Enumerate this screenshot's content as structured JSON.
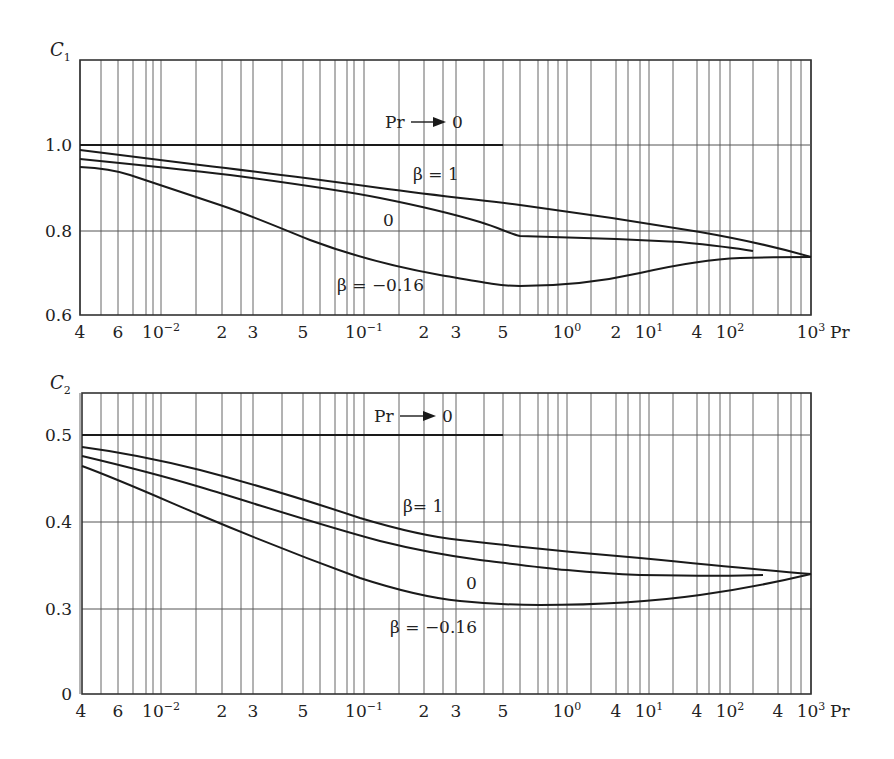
{
  "chart_data": [
    {
      "type": "line",
      "title": "",
      "ylabel": "C₁",
      "xlabel": "Pr",
      "x_scale": "log (nonuniform decades)",
      "x_tick_labels": [
        "4",
        "6",
        "10⁻²",
        "2",
        "3",
        "5",
        "10⁻¹",
        "2",
        "3",
        "5",
        "10⁰",
        "2",
        "10¹",
        "4",
        "10²",
        "10³",
        "Pr"
      ],
      "y_tick_labels": [
        "0.6",
        "0.8",
        "1.0"
      ],
      "ylim": [
        0.6,
        1.2
      ],
      "xlim": [
        0.004,
        1000
      ],
      "grid": true,
      "series": [
        {
          "name": "Pr → 0",
          "x": [
            0.004,
            0.5
          ],
          "values": [
            1.0,
            1.0
          ]
        },
        {
          "name": "β = 1",
          "x": [
            0.004,
            0.01,
            0.03,
            0.1,
            0.3,
            1,
            10,
            100,
            1000
          ],
          "values": [
            0.99,
            0.97,
            0.945,
            0.92,
            0.89,
            0.86,
            0.82,
            0.78,
            0.74
          ]
        },
        {
          "name": "0",
          "x": [
            0.004,
            0.01,
            0.03,
            0.1,
            0.3,
            0.6,
            1,
            10,
            200
          ],
          "values": [
            0.97,
            0.955,
            0.925,
            0.89,
            0.85,
            0.79,
            0.785,
            0.775,
            0.75
          ]
        },
        {
          "name": "β = −0.16",
          "x": [
            0.004,
            0.006,
            0.01,
            0.03,
            0.05,
            0.1,
            0.3,
            0.6,
            1,
            10,
            100,
            1000
          ],
          "values": [
            0.95,
            0.945,
            0.915,
            0.84,
            0.8,
            0.755,
            0.705,
            0.675,
            0.68,
            0.715,
            0.735,
            0.74
          ]
        }
      ],
      "annotations": [
        "Pr → 0",
        "β = 1",
        "0",
        "β = −0.16"
      ]
    },
    {
      "type": "line",
      "title": "",
      "ylabel": "C₂",
      "xlabel": "Pr",
      "x_scale": "log (nonuniform decades)",
      "x_tick_labels": [
        "4",
        "6",
        "10⁻²",
        "2",
        "3",
        "5",
        "10⁻¹",
        "2",
        "3",
        "5",
        "10⁰",
        "4",
        "10¹",
        "4",
        "10²",
        "4",
        "10³",
        "Pr"
      ],
      "y_tick_labels": [
        "0",
        "0.3",
        "0.4",
        "0.5"
      ],
      "ylim": [
        0,
        0.55
      ],
      "xlim": [
        0.004,
        1000
      ],
      "grid": true,
      "series": [
        {
          "name": "Pr → 0",
          "x": [
            0.004,
            0.5
          ],
          "values": [
            0.5,
            0.5
          ]
        },
        {
          "name": "β = 1",
          "x": [
            0.004,
            0.01,
            0.03,
            0.1,
            0.3,
            1,
            10,
            100,
            1000
          ],
          "values": [
            0.487,
            0.47,
            0.44,
            0.4,
            0.378,
            0.365,
            0.355,
            0.347,
            0.34
          ]
        },
        {
          "name": "0",
          "x": [
            0.004,
            0.01,
            0.03,
            0.1,
            0.3,
            1,
            10,
            100,
            300
          ],
          "values": [
            0.477,
            0.45,
            0.415,
            0.375,
            0.355,
            0.343,
            0.34,
            0.34,
            0.34
          ]
        },
        {
          "name": "β = −0.16",
          "x": [
            0.004,
            0.01,
            0.03,
            0.1,
            0.3,
            0.6,
            1,
            10,
            100,
            1000
          ],
          "values": [
            0.465,
            0.425,
            0.38,
            0.335,
            0.312,
            0.305,
            0.305,
            0.31,
            0.325,
            0.34
          ]
        }
      ],
      "annotations": [
        "Pr → 0",
        "β= 1",
        "0",
        "β = −0.16"
      ]
    }
  ],
  "top": {
    "ylabel": "C",
    "ylabel_sub": "1",
    "y_ticks": [
      {
        "label": "1.0",
        "y": 145
      },
      {
        "label": "0.8",
        "y": 231
      },
      {
        "label": "0.6",
        "y": 315
      }
    ],
    "x_ticks": [
      {
        "label": "4",
        "x": 80
      },
      {
        "label": "6",
        "x": 118
      },
      {
        "label": "10",
        "sup": "−2",
        "x": 161
      },
      {
        "label": "2",
        "x": 222
      },
      {
        "label": "3",
        "x": 253
      },
      {
        "label": "5",
        "x": 303
      },
      {
        "label": "10",
        "sup": "−1",
        "x": 364
      },
      {
        "label": "2",
        "x": 424
      },
      {
        "label": "3",
        "x": 456
      },
      {
        "label": "5",
        "x": 503
      },
      {
        "label": "10",
        "sup": "0",
        "x": 567
      },
      {
        "label": "2",
        "x": 616
      },
      {
        "label": "10",
        "sup": "1",
        "x": 649
      },
      {
        "label": "4",
        "x": 697
      },
      {
        "label": "10",
        "sup": "2",
        "x": 730
      },
      {
        "label": "10",
        "sup": "3",
        "x": 811
      }
    ],
    "pr_label": "Pr",
    "pr_limit_label": "Pr",
    "pr_limit_value": "0",
    "label_beta1": "β = 1",
    "label_beta0": "0",
    "label_betaneg": "β = −0.16"
  },
  "bottom": {
    "ylabel": "C",
    "ylabel_sub": "2",
    "y_ticks": [
      {
        "label": "0.5",
        "y": 435
      },
      {
        "label": "0.4",
        "y": 522
      },
      {
        "label": "0.3",
        "y": 609
      },
      {
        "label": "0",
        "y": 694
      }
    ],
    "x_ticks": [
      {
        "label": "4",
        "x": 81
      },
      {
        "label": "6",
        "x": 118
      },
      {
        "label": "10",
        "sup": "−2",
        "x": 161
      },
      {
        "label": "2",
        "x": 222
      },
      {
        "label": "3",
        "x": 253
      },
      {
        "label": "5",
        "x": 303
      },
      {
        "label": "10",
        "sup": "−1",
        "x": 364
      },
      {
        "label": "2",
        "x": 424
      },
      {
        "label": "3",
        "x": 456
      },
      {
        "label": "5",
        "x": 503
      },
      {
        "label": "10",
        "sup": "0",
        "x": 567
      },
      {
        "label": "4",
        "x": 616
      },
      {
        "label": "10",
        "sup": "1",
        "x": 649
      },
      {
        "label": "4",
        "x": 697
      },
      {
        "label": "10",
        "sup": "2",
        "x": 730
      },
      {
        "label": "4",
        "x": 778
      },
      {
        "label": "10",
        "sup": "3",
        "x": 811
      }
    ],
    "pr_label": "Pr",
    "pr_limit_label": "Pr",
    "pr_limit_value": "0",
    "label_beta1": "β= 1",
    "label_beta0": "0",
    "label_betaneg": "β = −0.16"
  },
  "gridlines_x": [
    80,
    101,
    118,
    133,
    146,
    153,
    161,
    196,
    222,
    241,
    253,
    282,
    303,
    320,
    335,
    347,
    354,
    364,
    399,
    424,
    443,
    456,
    484,
    503,
    520,
    538,
    548,
    558,
    567,
    591,
    616,
    628,
    640,
    649,
    673,
    697,
    709,
    720,
    730,
    753,
    778,
    791,
    801,
    811
  ],
  "colors": {
    "line": "#1a1a1a",
    "grid": "#555555",
    "background": "#ffffff"
  }
}
